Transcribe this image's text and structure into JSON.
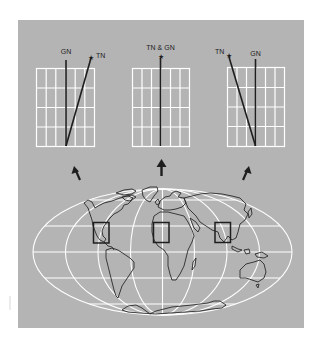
{
  "figure": {
    "colors": {
      "background": "#ffffff",
      "panel": "#b4b4b4",
      "grid": "#ffffff",
      "ink": "#1e1e1e"
    }
  },
  "panels": [
    {
      "id": "west",
      "labels": {
        "gn": "GN",
        "tn": "TN"
      },
      "relation": "TN east of GN",
      "arrow_direction": "up-left"
    },
    {
      "id": "central",
      "labels": {
        "combined": "TN & GN"
      },
      "relation": "TN coincides with GN",
      "arrow_direction": "up"
    },
    {
      "id": "east",
      "labels": {
        "gn": "GN",
        "tn": "TN"
      },
      "relation": "TN west of GN",
      "arrow_direction": "up-right"
    }
  ],
  "map": {
    "projection": "elliptical world map with graticule",
    "regions_highlighted": 3
  }
}
